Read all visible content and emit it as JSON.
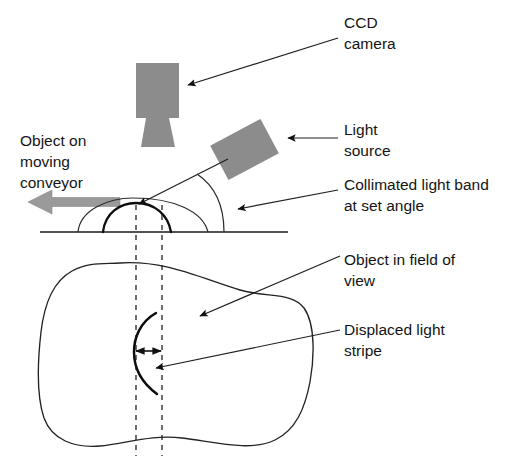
{
  "figure": {
    "background_color": "#ffffff",
    "line_color": "#1e1e1e",
    "device_fill_color": "#8c8c8c",
    "conveyor_arrow_color": "#9a9a9a",
    "width": 526,
    "height": 462
  },
  "labels": {
    "ccd_camera": {
      "line1": "CCD",
      "line2": "camera"
    },
    "light_source": {
      "line1": "Light",
      "line2": "source"
    },
    "collimated_band": {
      "line1": "Collimated light band",
      "line2": "at set angle"
    },
    "object_in_view": {
      "line1": "Object in field of",
      "line2": "view"
    },
    "displaced_stripe": {
      "line1": "Displaced light",
      "line2": "stripe"
    },
    "conveyor": {
      "line1": "Object on",
      "line2": "moving",
      "line3": "conveyor"
    }
  },
  "components": {
    "ccd_camera_body": "ccd-camera-body",
    "ccd_camera_lens": "ccd-camera-lens",
    "light_source_block": "light-source-block",
    "conveyor_direction_arrow": "conveyor-direction-arrow",
    "ground_line": "conveyor-ground-line",
    "object_side_profile": "object-side-profile",
    "light_band_on_object": "light-band-on-object",
    "incident_light_ray": "incident-light-ray",
    "set_angle_arc": "set-angle-arc",
    "sight_dashed_line_left": "sight-dashed-line-left",
    "sight_dashed_line_right": "sight-dashed-line-right",
    "object_top_view_outline": "object-top-view-outline",
    "displaced_stripe_arc": "displaced-stripe-arc",
    "displacement_measure_arrow": "displacement-measure-arrow"
  }
}
